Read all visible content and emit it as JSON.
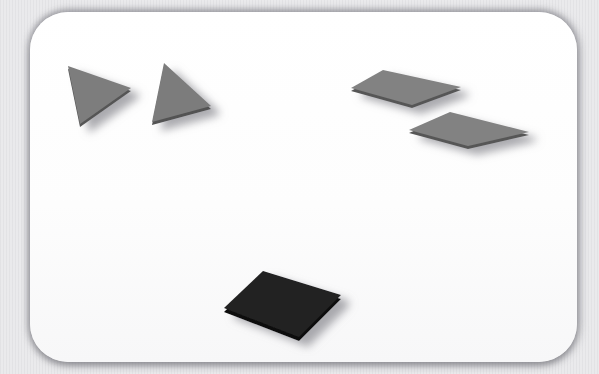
{
  "scene": {
    "background_color": "#e9e9eb",
    "board_color": "#fdfdfd",
    "shadow_color": "#9b9b9f"
  },
  "shapes": [
    {
      "name": "gray-triangle-small",
      "type": "triangle",
      "fill": "#7d7d7d",
      "edge": "#555555",
      "thickness": 3,
      "points": [
        [
          68,
          66
        ],
        [
          131,
          88
        ],
        [
          80,
          124
        ]
      ]
    },
    {
      "name": "gray-triangle-large",
      "type": "triangle",
      "fill": "#7b7b7b",
      "edge": "#525252",
      "thickness": 3,
      "points": [
        [
          164,
          63
        ],
        [
          211,
          106
        ],
        [
          152,
          122
        ]
      ]
    },
    {
      "name": "gray-diamond-upper",
      "type": "diamond",
      "fill": "#828282",
      "edge": "#575757",
      "thickness": 3,
      "points": [
        [
          351,
          88
        ],
        [
          383,
          70
        ],
        [
          461,
          87
        ],
        [
          412,
          105
        ]
      ]
    },
    {
      "name": "gray-diamond-lower",
      "type": "diamond",
      "fill": "#828282",
      "edge": "#575757",
      "thickness": 3,
      "points": [
        [
          409,
          130
        ],
        [
          450,
          112
        ],
        [
          529,
          132
        ],
        [
          468,
          146
        ]
      ]
    },
    {
      "name": "black-diamond",
      "type": "diamond",
      "fill": "#232323",
      "edge": "#101010",
      "thickness": 4,
      "points": [
        [
          224,
          308
        ],
        [
          263,
          271
        ],
        [
          341,
          295
        ],
        [
          299,
          337
        ]
      ]
    }
  ]
}
